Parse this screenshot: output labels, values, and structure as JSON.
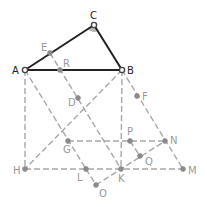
{
  "diagram": {
    "type": "geometry-construction",
    "colors": {
      "solid": "#222222",
      "dashed": "#a8a8a8",
      "point": "#8a8a8a",
      "angle_fill": "#b8b8b8"
    },
    "points": {
      "A": {
        "label": "A",
        "x": 25,
        "y": 70
      },
      "B": {
        "label": "B",
        "x": 122,
        "y": 70
      },
      "C": {
        "label": "C",
        "x": 94,
        "y": 25
      },
      "E": {
        "label": "E",
        "x": 50,
        "y": 53
      },
      "R": {
        "label": "R",
        "x": 60,
        "y": 70
      },
      "D": {
        "label": "D",
        "x": 78,
        "y": 98
      },
      "F": {
        "label": "F",
        "x": 137,
        "y": 96
      },
      "G": {
        "label": "G",
        "x": 68,
        "y": 141
      },
      "P": {
        "label": "P",
        "x": 130,
        "y": 141
      },
      "N": {
        "label": "N",
        "x": 165,
        "y": 141
      },
      "Q": {
        "label": "Q",
        "x": 140,
        "y": 156
      },
      "H": {
        "label": "H",
        "x": 25,
        "y": 169
      },
      "L": {
        "label": "L",
        "x": 86,
        "y": 169
      },
      "K": {
        "label": "K",
        "x": 121,
        "y": 169
      },
      "M": {
        "label": "M",
        "x": 183,
        "y": 169
      },
      "O": {
        "label": "O",
        "x": 96,
        "y": 185
      }
    },
    "solid_segments": [
      [
        "A",
        "B"
      ],
      [
        "B",
        "C"
      ],
      [
        "C",
        "A"
      ]
    ],
    "dashed_segments": [
      [
        "A",
        "H"
      ],
      [
        "B",
        "K"
      ],
      [
        "H",
        "M"
      ],
      [
        "A",
        "L"
      ],
      [
        "L",
        "O"
      ],
      [
        "E",
        "K"
      ],
      [
        "B",
        "H"
      ],
      [
        "G",
        "N"
      ],
      [
        "B",
        "M"
      ],
      [
        "O",
        "N"
      ],
      [
        "P",
        "Q"
      ]
    ],
    "angle_mark": {
      "vertex": "C",
      "note": "right angle at C (filled arc)"
    }
  }
}
